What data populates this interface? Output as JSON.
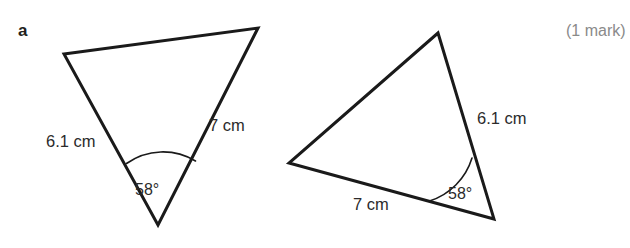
{
  "page": {
    "background_color": "#ffffff",
    "width": 630,
    "height": 248
  },
  "question": {
    "part_label": "a",
    "marks_text": "(1 mark)"
  },
  "style": {
    "stroke_color": "#1a1a1a",
    "stroke_width": 3,
    "arc_stroke_width": 1.6,
    "fill_color": "#ffffff",
    "text_color": "#2b2b2b",
    "marks_color": "#8a8a8a"
  },
  "figures": [
    {
      "id": "left-triangle",
      "name": "triangle-left",
      "vertices": [
        {
          "name": "top-left",
          "x": 64,
          "y": 54
        },
        {
          "name": "top-right",
          "x": 258,
          "y": 28
        },
        {
          "name": "bottom-apex",
          "x": 158,
          "y": 225
        }
      ],
      "polygon_points": "64,54 258,28 158,225",
      "side_labels": [
        {
          "name": "side-label-6-1cm",
          "text": "6.1 cm",
          "x": 46,
          "y": 133
        },
        {
          "name": "side-label-7cm",
          "text": "7 cm",
          "x": 209,
          "y": 117
        }
      ],
      "angle": {
        "name": "angle-58-degrees",
        "text": "58°",
        "label_x": 135,
        "label_y": 182,
        "vertex_x": 158,
        "vertex_y": 225,
        "arc_path": "M 126.5 163.5 A 63 63 0 0 1 195.5 161.0"
      }
    },
    {
      "id": "right-triangle",
      "name": "triangle-right",
      "vertices": [
        {
          "name": "apex",
          "x": 438,
          "y": 33
        },
        {
          "name": "left",
          "x": 289,
          "y": 163
        },
        {
          "name": "bottom-right",
          "x": 494,
          "y": 219
        }
      ],
      "polygon_points": "438,33 289,163 494,219",
      "side_labels": [
        {
          "name": "side-label-6-1cm",
          "text": "6.1 cm",
          "x": 477,
          "y": 110
        },
        {
          "name": "side-label-7cm",
          "text": "7 cm",
          "x": 353,
          "y": 196
        }
      ],
      "angle": {
        "name": "angle-58-degrees",
        "text": "58°",
        "label_x": 448,
        "label_y": 186,
        "vertex_x": 494,
        "vertex_y": 219,
        "arc_path": "M 472.0 158.0 A 65 65 0 0 1 429.5 201.0"
      }
    }
  ]
}
